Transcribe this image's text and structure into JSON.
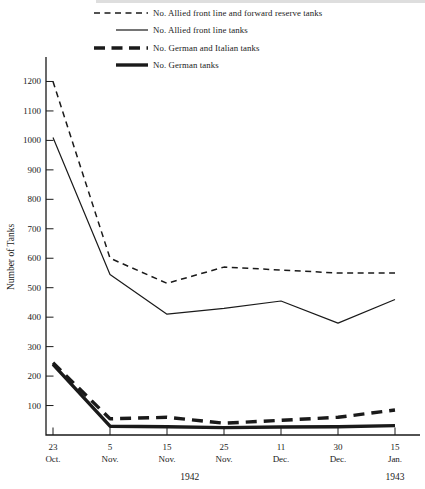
{
  "figure": {
    "background": "#ffffff",
    "ink_color": "#1a1a1a"
  },
  "chart_data": {
    "type": "line",
    "title": "",
    "xlabel": "",
    "ylabel": "Number of Tanks",
    "ylim": [
      0,
      1280
    ],
    "grid": false,
    "legend_position": "top-left",
    "yticks": [
      100,
      200,
      300,
      400,
      500,
      600,
      700,
      800,
      900,
      1000,
      1100,
      1200
    ],
    "categories": [
      {
        "day": "23",
        "month": "Oct."
      },
      {
        "day": "5",
        "month": "Nov."
      },
      {
        "day": "15",
        "month": "Nov."
      },
      {
        "day": "25",
        "month": "Nov."
      },
      {
        "day": "11",
        "month": "Dec."
      },
      {
        "day": "30",
        "month": "Dec."
      },
      {
        "day": "15",
        "month": "Jan."
      }
    ],
    "year_labels": [
      {
        "text": "1942",
        "under_index": 2.4
      },
      {
        "text": "1943",
        "under_index": 6
      }
    ],
    "series": [
      {
        "name": "No. Allied front line and forward reserve tanks",
        "style": "thin-dashed",
        "values": [
          1200,
          600,
          515,
          570,
          560,
          550,
          550
        ]
      },
      {
        "name": "No. Allied front line tanks",
        "style": "thin-solid",
        "values": [
          1010,
          545,
          410,
          430,
          455,
          380,
          460
        ]
      },
      {
        "name": "No. German and Italian tanks",
        "style": "thick-dashed",
        "values": [
          245,
          55,
          60,
          40,
          50,
          60,
          85
        ]
      },
      {
        "name": "No. German tanks",
        "style": "thick-solid",
        "values": [
          240,
          30,
          28,
          25,
          27,
          28,
          32
        ]
      }
    ]
  }
}
